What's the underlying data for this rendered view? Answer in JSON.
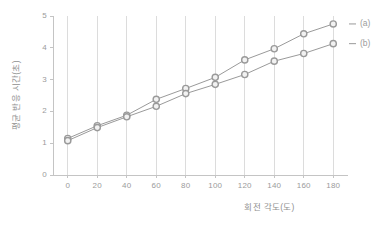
{
  "chart_data": {
    "type": "line",
    "title": "",
    "xlabel": "회전 각도(도)",
    "ylabel": "평균 반응 시간(초)",
    "x": [
      0,
      20,
      40,
      60,
      80,
      100,
      120,
      140,
      160,
      180
    ],
    "xlim": [
      -10,
      190
    ],
    "ylim": [
      0,
      5
    ],
    "xticks": [
      0,
      20,
      40,
      60,
      80,
      100,
      120,
      140,
      160,
      180
    ],
    "yticks": [
      0,
      1,
      2,
      3,
      4,
      5
    ],
    "grid": "vertical",
    "legend_position": "right-outside",
    "marker": "open-circle",
    "line_color": "#9a9a9a",
    "marker_edge_color": "#9a9a9a",
    "marker_face_color": "#f2f2f2",
    "series": [
      {
        "name": "(a)",
        "values": [
          1.15,
          1.55,
          1.88,
          2.38,
          2.72,
          3.07,
          3.62,
          3.97,
          4.44,
          4.75
        ]
      },
      {
        "name": "(b)",
        "values": [
          1.08,
          1.49,
          1.83,
          2.16,
          2.56,
          2.85,
          3.16,
          3.58,
          3.82,
          4.13
        ]
      }
    ]
  },
  "axis": {
    "ytick_labels": [
      "0",
      "1",
      "2",
      "3",
      "4",
      "5"
    ],
    "xtick_labels": [
      "0",
      "20",
      "40",
      "60",
      "80",
      "100",
      "120",
      "140",
      "160",
      "180"
    ]
  },
  "legend": {
    "items": [
      {
        "label": "(a)"
      },
      {
        "label": "(b)"
      }
    ]
  }
}
